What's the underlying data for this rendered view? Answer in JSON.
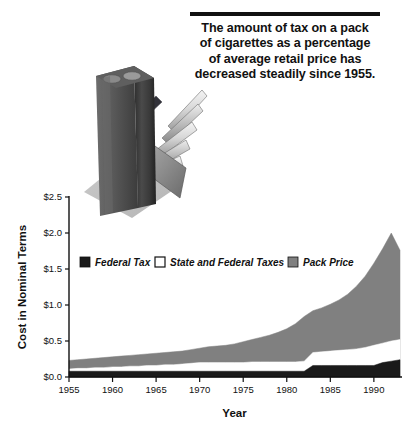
{
  "title": {
    "text": "The amount of tax on a pack\nof cigarettes as a percentage\nof average retail price has\ndecreased steadily since 1955.",
    "rule_color": "#111111"
  },
  "illustration": {
    "name": "cigarette-pack-photo",
    "description": "Grayscale photo of an opened cigarette pack with cigarettes"
  },
  "colors": {
    "federal_tax": "#1a1a1a",
    "state_and_federal_taxes": "#ffffff",
    "pack_price": "#808080",
    "axis": "#111111",
    "background": "#ffffff"
  },
  "chart_data": {
    "type": "area",
    "title": "",
    "xlabel": "Year",
    "ylabel": "Cost in Nominal Terms",
    "xlim": [
      1955,
      1993
    ],
    "ylim": [
      0.0,
      2.5
    ],
    "xticks": [
      1955,
      1960,
      1965,
      1970,
      1975,
      1980,
      1985,
      1990
    ],
    "xtick_labels": [
      "1955",
      "1960",
      "1965",
      "1970",
      "1975",
      "1980",
      "1985",
      "1990"
    ],
    "yticks": [
      0.0,
      0.5,
      1.0,
      1.5,
      2.0,
      2.5
    ],
    "ytick_labels": [
      "$0.0",
      "$0.5",
      "$1.0",
      "$1.5",
      "$2.0",
      "$2.5"
    ],
    "grid": false,
    "stacked": false,
    "legend_position": "inside-upper-left",
    "x": [
      1955,
      1956,
      1957,
      1958,
      1959,
      1960,
      1961,
      1962,
      1963,
      1964,
      1965,
      1966,
      1967,
      1968,
      1969,
      1970,
      1971,
      1972,
      1973,
      1974,
      1975,
      1976,
      1977,
      1978,
      1979,
      1980,
      1981,
      1982,
      1983,
      1984,
      1985,
      1986,
      1987,
      1988,
      1989,
      1990,
      1991,
      1992,
      1993
    ],
    "series": [
      {
        "name": "Pack Price",
        "color": "#808080",
        "values": [
          0.23,
          0.24,
          0.25,
          0.26,
          0.27,
          0.28,
          0.29,
          0.3,
          0.31,
          0.32,
          0.33,
          0.34,
          0.35,
          0.36,
          0.38,
          0.4,
          0.42,
          0.43,
          0.44,
          0.46,
          0.49,
          0.52,
          0.55,
          0.58,
          0.62,
          0.67,
          0.74,
          0.84,
          0.92,
          0.96,
          1.01,
          1.07,
          1.15,
          1.26,
          1.4,
          1.58,
          1.78,
          2.0,
          1.76
        ]
      },
      {
        "name": "State and Federal Taxes",
        "color": "#ffffff",
        "values": [
          0.11,
          0.12,
          0.12,
          0.13,
          0.13,
          0.14,
          0.14,
          0.15,
          0.15,
          0.16,
          0.16,
          0.17,
          0.17,
          0.18,
          0.19,
          0.2,
          0.2,
          0.2,
          0.2,
          0.2,
          0.2,
          0.21,
          0.21,
          0.21,
          0.21,
          0.21,
          0.21,
          0.22,
          0.34,
          0.35,
          0.36,
          0.37,
          0.38,
          0.39,
          0.41,
          0.44,
          0.47,
          0.5,
          0.52
        ]
      },
      {
        "name": "Federal Tax",
        "color": "#1a1a1a",
        "values": [
          0.08,
          0.08,
          0.08,
          0.08,
          0.08,
          0.08,
          0.08,
          0.08,
          0.08,
          0.08,
          0.08,
          0.08,
          0.08,
          0.08,
          0.08,
          0.08,
          0.08,
          0.08,
          0.08,
          0.08,
          0.08,
          0.08,
          0.08,
          0.08,
          0.08,
          0.08,
          0.08,
          0.08,
          0.16,
          0.16,
          0.16,
          0.16,
          0.16,
          0.16,
          0.16,
          0.16,
          0.2,
          0.22,
          0.24
        ]
      }
    ],
    "legend": [
      {
        "label": "Federal Tax",
        "color": "#1a1a1a",
        "swatch": "filled"
      },
      {
        "label": "State and Federal Taxes",
        "color": "#ffffff",
        "swatch": "outlined"
      },
      {
        "label": "Pack Price",
        "color": "#808080",
        "swatch": "filled"
      }
    ]
  }
}
